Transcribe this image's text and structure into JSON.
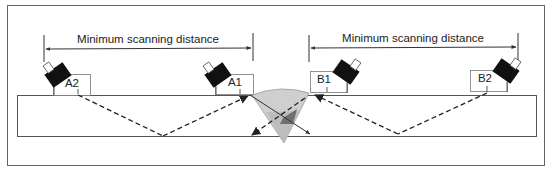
{
  "diagram": {
    "dimensions": [
      {
        "id": "left",
        "label": "Minimum scanning distance"
      },
      {
        "id": "right",
        "label": "Minimum scanning distance"
      }
    ],
    "probes": [
      {
        "id": "A2",
        "label": "A2"
      },
      {
        "id": "A1",
        "label": "A1"
      },
      {
        "id": "B1",
        "label": "B1"
      },
      {
        "id": "B2",
        "label": "B2"
      }
    ],
    "colors": {
      "frame": "#666666",
      "plate_line": "#555555",
      "probe": "#111111",
      "weld_fill": "#c8c8c8",
      "weld_dark": "#6f6f6f",
      "beam": "#222222"
    }
  }
}
